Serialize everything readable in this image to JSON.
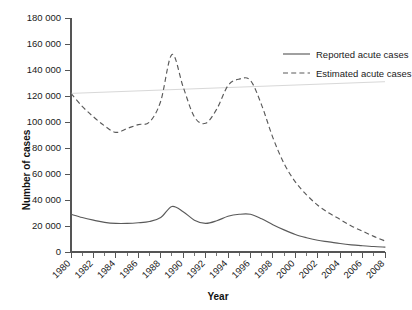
{
  "chart_data": {
    "type": "line",
    "title": "",
    "xlabel": "Year",
    "ylabel": "Number of cases",
    "xlim": [
      1980,
      2008
    ],
    "ylim": [
      0,
      180000
    ],
    "grid": false,
    "legend_position": "top-right",
    "ytick_labels": [
      "180 000",
      "160 000",
      "140 000",
      "120 000",
      "100 000",
      "80 000",
      "60 000",
      "40 000",
      "20 000",
      "0"
    ],
    "ytick_values": [
      180000,
      160000,
      140000,
      120000,
      100000,
      80000,
      60000,
      40000,
      20000,
      0
    ],
    "xtick_labels": [
      "1980",
      "1982",
      "1984",
      "1986",
      "1988",
      "1990",
      "1992",
      "1994",
      "1996",
      "1998",
      "2000",
      "2002",
      "2004",
      "2006",
      "2008"
    ],
    "xtick_values": [
      1980,
      1982,
      1984,
      1986,
      1988,
      1990,
      1992,
      1994,
      1996,
      1998,
      2000,
      2002,
      2004,
      2006,
      2008
    ],
    "x": [
      1980,
      1981,
      1982,
      1983,
      1984,
      1985,
      1986,
      1987,
      1988,
      1989,
      1990,
      1991,
      1992,
      1993,
      1994,
      1995,
      1996,
      1997,
      1998,
      1999,
      2000,
      2001,
      2002,
      2003,
      2004,
      2005,
      2006,
      2007,
      2008
    ],
    "series": [
      {
        "name": "Reported acute cases",
        "style": "solid",
        "color": "#5a5a5a",
        "values": [
          29000,
          26500,
          24500,
          22800,
          22000,
          22000,
          22500,
          23500,
          26500,
          35000,
          31000,
          24500,
          22000,
          24000,
          27500,
          29000,
          29000,
          25500,
          21000,
          17000,
          13500,
          11000,
          9000,
          7800,
          6500,
          5500,
          4800,
          4200,
          3800
        ]
      },
      {
        "name": "Estimated acute cases",
        "style": "dashed",
        "color": "#5a5a5a",
        "values": [
          122000,
          112000,
          104000,
          97000,
          92000,
          95000,
          98000,
          100000,
          116000,
          152000,
          127000,
          104000,
          99000,
          110000,
          128000,
          133000,
          132000,
          113000,
          88000,
          68000,
          54000,
          44000,
          36000,
          30000,
          25000,
          20000,
          16000,
          12000,
          8500
        ]
      }
    ],
    "trend_line": {
      "name": "baseline-trend",
      "color": "#d8d8d8",
      "x": [
        1980,
        2008
      ],
      "values": [
        122000,
        131000
      ]
    },
    "legend": [
      {
        "label": "Reported acute cases",
        "style": "solid"
      },
      {
        "label": "Estimated acute cases",
        "style": "dashed"
      }
    ]
  }
}
